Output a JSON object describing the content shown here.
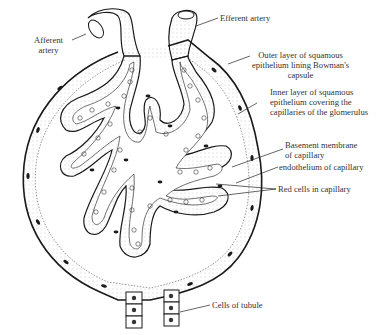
{
  "figure": {
    "colors": {
      "ink": "#1a1a1a",
      "stipple": "#888888",
      "background": "#ffffff",
      "label_text": "#333333"
    }
  },
  "labels": {
    "afferent_artery": {
      "line1": "Afferent",
      "line2": "artery"
    },
    "efferent_artery": "Efferent artery",
    "outer_layer": {
      "line1": "Outer layer of squamous",
      "line2": "epithelium lining Bowman's",
      "line3": "capsule"
    },
    "inner_layer": {
      "line1": "Inner layer of squamous",
      "line2": "epithelium covering the",
      "line3": "capillaries of the glomerulus"
    },
    "basement_membrane": {
      "line1": "Basement membrane",
      "line2": "of capillary"
    },
    "endothelium": "endothelium of capillary",
    "red_cells": "Red cells in capillary",
    "tubule_cells": "Cells of tubule"
  }
}
